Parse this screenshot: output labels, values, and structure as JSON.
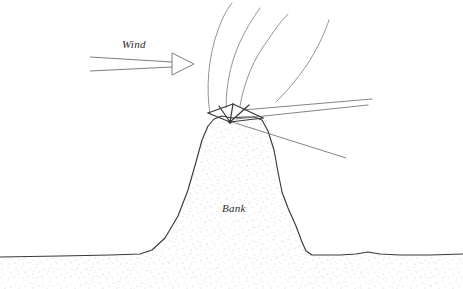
{
  "figure": {
    "canvas": {
      "width": 463,
      "height": 289,
      "background": "#ffffff"
    },
    "style": {
      "ink_dark": "#3a3a3a",
      "ink_mid": "#6e6e6e",
      "ink_light": "#8d8d8d",
      "stipple": "#bfbfc4",
      "text": "#2b2b2b"
    }
  },
  "labels": {
    "wind": "Wind",
    "bank": "Bank"
  },
  "annotations": [
    {
      "name": "wind-label",
      "text": "Wind",
      "x": 122,
      "y": 48,
      "style": "italic-serif"
    },
    {
      "name": "bank-label",
      "text": "Bank",
      "x": 222,
      "y": 212,
      "style": "italic-serif"
    }
  ],
  "wind_arrow": {
    "name": "wind-arrow",
    "description": "tapered open arrow pointing right",
    "tail_x": 90,
    "tip_x": 194,
    "tip_y": 64,
    "tail_top_y": 57,
    "tail_bottom_y": 71,
    "head_length": 22,
    "head_half_height": 11,
    "filled": false
  },
  "bank": {
    "name": "bank-profile",
    "description": "stippled earth bank with concave left slope and steeper right slope",
    "ground_left_y": 255,
    "ground_right_y": 255,
    "peak_x": 232,
    "peak_y": 118,
    "outline_path": "M 0,257 L 60,256 L 110,255 L 140,254 L 152,250 L 165,238 L 178,216 L 188,190 L 196,162 L 202,140 L 208,126 L 214,119 L 222,116 L 232,118 L 244,117 L 254,117 L 262,120 L 268,131 L 274,150 L 278,172 L 282,192 L 288,208 L 296,226 L 302,242 L 306,251 L 312,255 L 340,255 L 356,254 L 368,252 L 380,254 L 400,255 L 430,255 L 463,254",
    "fill": "#ffffff",
    "stipple_color": "#bfbfc4"
  },
  "streamlines": {
    "name": "wind-streamlines",
    "count": 4,
    "description": "curved flow lines separating over the crest and arcing up to the right",
    "paths": [
      "M 210,114 C 206,88 208,58 218,30 C 224,14 228,8 232,3",
      "M 226,108 C 226,82 232,56 244,34 C 250,22 256,14 260,8",
      "M 240,106 C 244,82 254,58 268,40 C 276,28 282,20 288,14",
      "M 276,102 C 292,86 308,66 318,46 C 324,34 327,26 329,20"
    ]
  },
  "crest_structure": {
    "name": "crest-fan",
    "description": "fan of straight lines radiating from a single vertex at the bank crest",
    "vertex": {
      "x": 230,
      "y": 122
    },
    "spokes": [
      {
        "name": "spoke-upper-left",
        "x2": 208,
        "y2": 113
      },
      {
        "name": "spoke-left",
        "x2": 219,
        "y2": 106
      },
      {
        "name": "spoke-top",
        "x2": 233,
        "y2": 104
      },
      {
        "name": "spoke-right",
        "x2": 249,
        "y2": 105
      },
      {
        "name": "spoke-lower-right",
        "x2": 263,
        "y2": 118
      }
    ],
    "chords": [
      {
        "name": "chord-left",
        "x1": 208,
        "y1": 113,
        "x2": 233,
        "y2": 104
      },
      {
        "name": "chord-right",
        "x1": 233,
        "y1": 104,
        "x2": 263,
        "y2": 118
      }
    ]
  },
  "rays": {
    "name": "lee-rays",
    "description": "three long straight rays projecting down-wind to the right of the crest",
    "origin": {
      "x": 230,
      "y": 122
    },
    "lines": [
      {
        "name": "ray-upper",
        "x1": 243,
        "y1": 110,
        "x2": 372,
        "y2": 99
      },
      {
        "name": "ray-middle",
        "x1": 236,
        "y1": 119,
        "x2": 368,
        "y2": 105
      },
      {
        "name": "ray-lower",
        "x1": 232,
        "y1": 122,
        "x2": 346,
        "y2": 158
      }
    ]
  }
}
